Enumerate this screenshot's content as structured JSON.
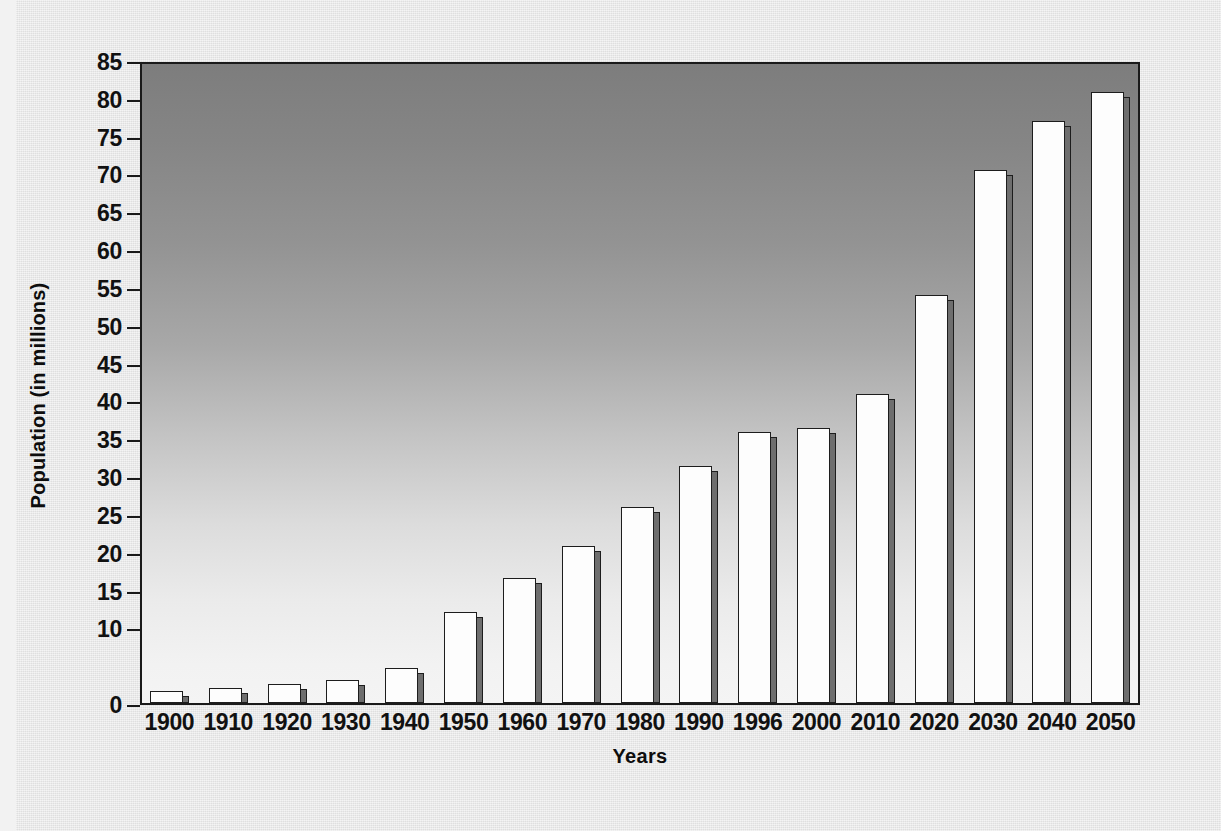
{
  "chart_data": {
    "type": "bar",
    "title": "",
    "xlabel": "Years",
    "ylabel": "Population (in millions)",
    "categories": [
      "1900",
      "1910",
      "1920",
      "1930",
      "1940",
      "1950",
      "1960",
      "1970",
      "1980",
      "1990",
      "1996",
      "2000",
      "2010",
      "2020",
      "2030",
      "2040",
      "2050"
    ],
    "values": [
      1.6,
      2.0,
      2.5,
      3.0,
      4.6,
      12.0,
      16.5,
      20.8,
      25.9,
      31.3,
      35.8,
      36.3,
      40.9,
      53.9,
      70.5,
      77.0,
      80.8
    ],
    "ylim": [
      0,
      85
    ],
    "ytick_labels": [
      "85",
      "80",
      "75",
      "70",
      "65",
      "60",
      "55",
      "50",
      "45",
      "40",
      "35",
      "30",
      "25",
      "20",
      "15",
      "10",
      "0"
    ],
    "ytick_values": [
      85,
      80,
      75,
      70,
      65,
      60,
      55,
      50,
      45,
      40,
      35,
      30,
      25,
      20,
      15,
      10,
      0
    ],
    "grid": false,
    "legend": false,
    "bar_fill_color": "#fdfdfd",
    "bar_edge_color": "#1d1d1d",
    "bar_side_color": "#6e6e6e",
    "plot_background": "vertical gradient dark gray to white",
    "page_background": "#e7e7e7"
  }
}
